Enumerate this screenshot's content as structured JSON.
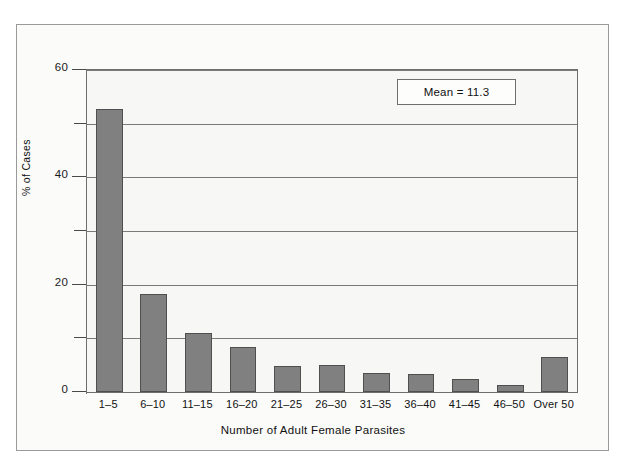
{
  "chart_data": {
    "type": "bar",
    "title": "",
    "xlabel": "Number of Adult Female Parasites",
    "ylabel": "% of Cases",
    "categories": [
      "1–5",
      "6–10",
      "11–15",
      "16–20",
      "21–25",
      "26–30",
      "31–35",
      "36–40",
      "41–45",
      "46–50",
      "Over 50"
    ],
    "values": [
      52.8,
      18.3,
      11.0,
      8.4,
      4.9,
      5.0,
      3.6,
      3.4,
      2.4,
      1.4,
      6.6
    ],
    "ylim": [
      0,
      60
    ],
    "xlim_note": "categorical",
    "ytick_labels": [
      "0",
      "20",
      "40",
      "60"
    ],
    "ytick_values": [
      0,
      20,
      40,
      60
    ],
    "gridline_values": [
      10,
      20,
      30,
      40,
      50,
      60
    ],
    "minor_tick_values": [
      10,
      30,
      50
    ],
    "grid": true,
    "legend": false,
    "legend_position": "none",
    "bar_color": "#808080",
    "bar_border_color": "#4f4f4f",
    "plot_background": "#f7f7f6",
    "figure_background": "#fbfbfa",
    "axis_color": "#6e6e6e",
    "annotations": [
      {
        "name": "mean-annotation",
        "text": "Mean = 11.3",
        "boxed": true
      }
    ]
  },
  "axes": {
    "y_title": "% of Cases",
    "x_title": "Number of Adult Female Parasites",
    "y_labels": [
      {
        "value": 60,
        "text": "60"
      },
      {
        "value": 40,
        "text": "40"
      },
      {
        "value": 20,
        "text": "20"
      },
      {
        "value": 0,
        "text": "0"
      }
    ]
  },
  "annotation": {
    "mean_label": "Mean = 11.3"
  }
}
